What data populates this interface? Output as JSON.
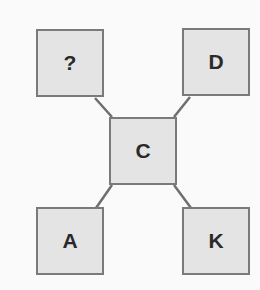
{
  "diagram": {
    "type": "tree",
    "colors": {
      "node_fill": "#e4e4e4",
      "node_border": "#7a7a7a",
      "link": "#6e6e6e",
      "text": "#2a2a2a"
    },
    "nodes": {
      "top_left": {
        "label": "?"
      },
      "top_right": {
        "label": "D"
      },
      "center": {
        "label": "C"
      },
      "bottom_left": {
        "label": "A"
      },
      "bottom_right": {
        "label": "K"
      }
    },
    "edges": [
      [
        "center",
        "top_left"
      ],
      [
        "center",
        "top_right"
      ],
      [
        "center",
        "bottom_left"
      ],
      [
        "center",
        "bottom_right"
      ]
    ]
  }
}
